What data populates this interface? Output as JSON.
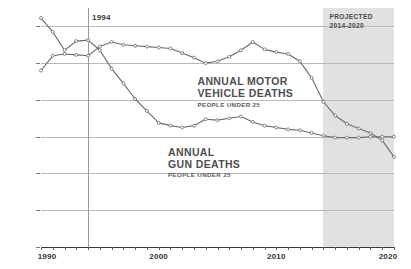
{
  "chart_data": {
    "type": "line",
    "title": "",
    "xlabel": "",
    "ylabel": "",
    "xlim": [
      1990,
      2020
    ],
    "ylim": [
      0,
      13000
    ],
    "grid": true,
    "legend_position": "inline-annotation",
    "y_ticks": [
      "0",
      "2,000",
      "4,000",
      "6,000",
      "8,000",
      "10,000",
      "12,000"
    ],
    "y_tick_values": [
      0,
      2000,
      4000,
      6000,
      8000,
      10000,
      12000
    ],
    "x_ticks": [
      "1990",
      "2000",
      "2010",
      "2020"
    ],
    "x_tick_values": [
      1990,
      2000,
      2010,
      2020
    ],
    "annotations": [
      {
        "name": "year-marker",
        "text": "1994",
        "x": 1994
      },
      {
        "name": "projected-band",
        "text": "PROJECTED",
        "text2": "2014-2020",
        "x_start": 2014,
        "x_end": 2020
      }
    ],
    "x": [
      1990,
      1991,
      1992,
      1993,
      1994,
      1995,
      1996,
      1997,
      1998,
      1999,
      2000,
      2001,
      2002,
      2003,
      2004,
      2005,
      2006,
      2007,
      2008,
      2009,
      2010,
      2011,
      2012,
      2013,
      2014,
      2015,
      2016,
      2017,
      2018,
      2019,
      2020
    ],
    "series": [
      {
        "name": "ANNUAL MOTOR VEHICLE DEATHS",
        "sublabel": "PEOPLE UNDER 25",
        "color": "#6b6b6b",
        "values": [
          9600,
          10400,
          10500,
          10450,
          10400,
          10900,
          11150,
          11000,
          10950,
          10900,
          10850,
          10800,
          10550,
          10300,
          10000,
          10100,
          10350,
          10700,
          11150,
          10750,
          10600,
          10500,
          10100,
          9200,
          7900,
          7150,
          6700,
          6450,
          6200,
          5800,
          4900
        ]
      },
      {
        "name": "ANNUAL GUN DEATHS",
        "sublabel": "PEOPLE UNDER 25",
        "color": "#6b6b6b",
        "values": [
          12450,
          11700,
          10700,
          11200,
          11250,
          10700,
          9700,
          8900,
          8050,
          7400,
          6750,
          6600,
          6500,
          6600,
          6950,
          6900,
          7000,
          7100,
          6800,
          6600,
          6500,
          6400,
          6350,
          6200,
          6050,
          5950,
          5950,
          5950,
          6000,
          6000,
          6000
        ]
      }
    ]
  },
  "motor_label": {
    "line1": "ANNUAL MOTOR",
    "line2": "VEHICLE DEATHS",
    "sub": "PEOPLE UNDER 25"
  },
  "gun_label": {
    "line1": "ANNUAL",
    "line2": "GUN DEATHS",
    "sub": "PEOPLE UNDER 25"
  },
  "projected": {
    "line1": "PROJECTED",
    "line2": "2014-2020"
  },
  "year_marker": {
    "label": "1994"
  },
  "colors": {
    "line": "#6b6b6b",
    "grid": "#b9b9b9",
    "band": "#dcdcdc",
    "text": "#444444"
  }
}
